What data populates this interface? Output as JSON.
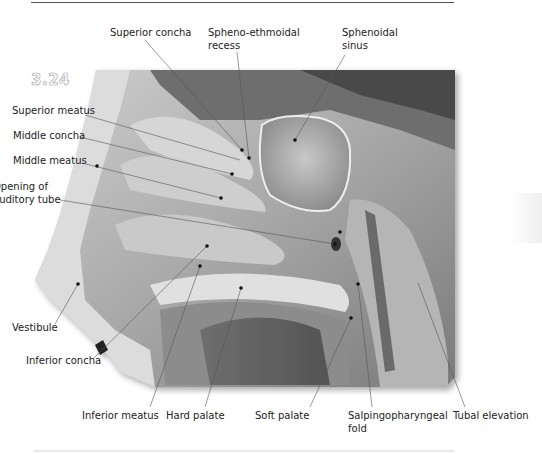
{
  "figure": {
    "number": "3.24"
  },
  "labels": {
    "superior_concha": "Superior concha",
    "spheno_ethmoidal_recess": [
      "Spheno-ethmoidal",
      "recess"
    ],
    "sphenoidal_sinus": [
      "Sphenoidal",
      "sinus"
    ],
    "superior_meatus": "Superior meatus",
    "middle_concha": "Middle concha",
    "middle_meatus": "Middle meatus",
    "opening_of_auditory_tube": [
      "Opening of",
      "auditory tube"
    ],
    "vestibule": "Vestibule",
    "inferior_concha": "Inferior concha",
    "inferior_meatus": "Inferior meatus",
    "hard_palate": "Hard palate",
    "soft_palate": "Soft palate",
    "salpingopharyngeal_fold": [
      "Salpingopharyngeal",
      "fold"
    ],
    "tubal_elevation": "Tubal elevation"
  },
  "colors": {
    "text": "#222222",
    "leader_line": "#555555",
    "photo_tone": "#9a9a9a"
  }
}
